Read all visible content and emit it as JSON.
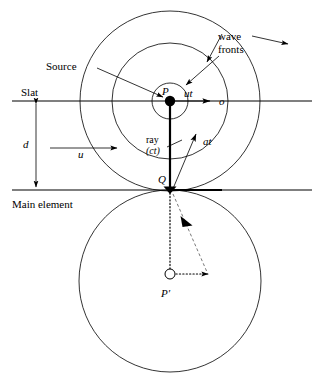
{
  "figure": {
    "type": "physics-optics-diagram"
  },
  "labels": {
    "slat": "Slat",
    "main_element": "Main element",
    "source": "Source",
    "wave_fronts": "wave\nfronts",
    "wave_fronts_line1": "wave",
    "wave_fronts_line2": "fronts",
    "distance_d": "d",
    "velocity_u": "u",
    "point_p": "P",
    "point_q": "Q",
    "point_p_prime": "P′",
    "ut": "ut",
    "at": "at",
    "ray_line1": "ray",
    "ray_line2": "(ct)",
    "o_axis": "o"
  },
  "geometry": {
    "source_point": {
      "x": 170,
      "y": 101
    },
    "q_point": {
      "x": 170,
      "y": 190
    },
    "p_prime_point": {
      "x": 170,
      "y": 274
    },
    "slat_line_y": 101,
    "main_element_line_y": 190,
    "separation_d": 89,
    "circles_at_p": [
      {
        "name": "ut-circle",
        "r": 18
      },
      {
        "name": "mid-wavefront",
        "r": 58
      },
      {
        "name": "outer-wavefront",
        "r": 90
      }
    ],
    "circle_at_q": {
      "name": "lower-wavefront",
      "cx": 170,
      "cy": 281,
      "r": 91
    }
  },
  "colors": {
    "ink": "#000000",
    "background": "#ffffff",
    "dashed_gray": "#555555"
  }
}
